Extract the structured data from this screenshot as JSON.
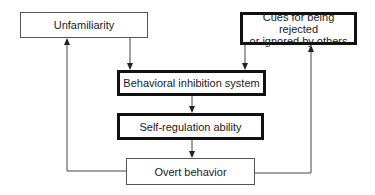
{
  "diagram": {
    "nodes": {
      "unfamiliarity": {
        "label": "Unfamiliarity",
        "emphasis": false
      },
      "cues": {
        "label_line1": "Cues for being rejected",
        "label_line2": "or ignored by others",
        "emphasis": true
      },
      "bis": {
        "label": "Behavioral inhibition system",
        "emphasis": true
      },
      "sra": {
        "label": "Self-regulation ability",
        "emphasis": true
      },
      "overt": {
        "label": "Overt behavior",
        "emphasis": false
      }
    },
    "edges": [
      {
        "from": "Unfamiliarity",
        "to": "Behavioral inhibition system"
      },
      {
        "from": "Cues for being rejected or ignored by others",
        "to": "Behavioral inhibition system"
      },
      {
        "from": "Behavioral inhibition system",
        "to": "Self-regulation ability"
      },
      {
        "from": "Self-regulation ability",
        "to": "Overt behavior"
      },
      {
        "from": "Overt behavior",
        "to": "Unfamiliarity"
      },
      {
        "from": "Overt behavior",
        "to": "Cues for being rejected or ignored by others"
      }
    ],
    "colors": {
      "line": "#444444",
      "thick_border": "#111111",
      "text": "#1a1a1a"
    }
  }
}
